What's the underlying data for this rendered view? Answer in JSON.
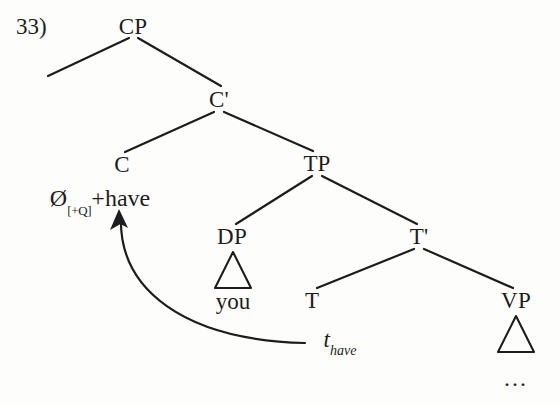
{
  "figure": {
    "example_number": "33)",
    "background_color": "#fdfdfc",
    "ink_color": "#1d1d1d"
  },
  "tree": {
    "nodes": {
      "cp": {
        "label": "CP",
        "x": 133,
        "y": 26
      },
      "cbar": {
        "label": "C'",
        "x": 219,
        "y": 99
      },
      "c": {
        "label": "C",
        "x": 122,
        "y": 164
      },
      "tp": {
        "label": "TP",
        "x": 317,
        "y": 163
      },
      "dp": {
        "label": "DP",
        "x": 232,
        "y": 236
      },
      "tbar": {
        "label": "T'",
        "x": 419,
        "y": 236
      },
      "t": {
        "label": "T",
        "x": 312,
        "y": 300
      },
      "vp": {
        "label": "VP",
        "x": 516,
        "y": 300
      }
    },
    "terminals": {
      "c_head": {
        "null_symbol": "Ø",
        "feature": "[+Q]",
        "suffix": "+have",
        "x": 100,
        "y": 200
      },
      "dp_content": {
        "label": "you",
        "x": 233,
        "y": 301
      },
      "trace": {
        "symbol": "t",
        "subscript": "have",
        "x": 340,
        "y": 342
      },
      "vp_content": {
        "label": "...",
        "x": 516,
        "y": 378
      }
    },
    "triangles": {
      "dp_triangle": {
        "apex_x": 233,
        "apex_y": 252,
        "left_x": 215,
        "right_x": 251,
        "base_y": 288
      },
      "vp_triangle": {
        "apex_x": 516,
        "apex_y": 316,
        "left_x": 498,
        "right_x": 534,
        "base_y": 352
      }
    },
    "branches": [
      {
        "name": "cp-to-spec",
        "from": "CP",
        "to": "empty-specifier",
        "x1": 129,
        "y1": 38,
        "x2": 48,
        "y2": 76
      },
      {
        "name": "cp-to-cbar",
        "from": "CP",
        "to": "C'",
        "x1": 138,
        "y1": 38,
        "x2": 221,
        "y2": 86
      },
      {
        "name": "cbar-to-c",
        "from": "C'",
        "to": "C",
        "x1": 214,
        "y1": 112,
        "x2": 125,
        "y2": 152
      },
      {
        "name": "cbar-to-tp",
        "from": "C'",
        "to": "TP",
        "x1": 224,
        "y1": 112,
        "x2": 313,
        "y2": 151
      },
      {
        "name": "tp-to-dp",
        "from": "TP",
        "to": "DP",
        "x1": 312,
        "y1": 176,
        "x2": 236,
        "y2": 224
      },
      {
        "name": "tp-to-tbar",
        "from": "TP",
        "to": "T'",
        "x1": 322,
        "y1": 176,
        "x2": 417,
        "y2": 224
      },
      {
        "name": "tbar-to-t",
        "from": "T'",
        "to": "T",
        "x1": 414,
        "y1": 249,
        "x2": 317,
        "y2": 288
      },
      {
        "name": "tbar-to-vp",
        "from": "T'",
        "to": "VP",
        "x1": 424,
        "y1": 249,
        "x2": 513,
        "y2": 288
      }
    ],
    "movement_arrow": {
      "name": "head-movement-arrow",
      "from_label": "t_have",
      "to_label": "C head",
      "start_x": 305,
      "start_y": 343,
      "control1_x": 185,
      "control1_y": 340,
      "control2_x": 118,
      "control2_y": 290,
      "end_x": 121,
      "end_y": 216,
      "arrowhead_tip_x": 119,
      "arrowhead_tip_y": 209
    }
  }
}
